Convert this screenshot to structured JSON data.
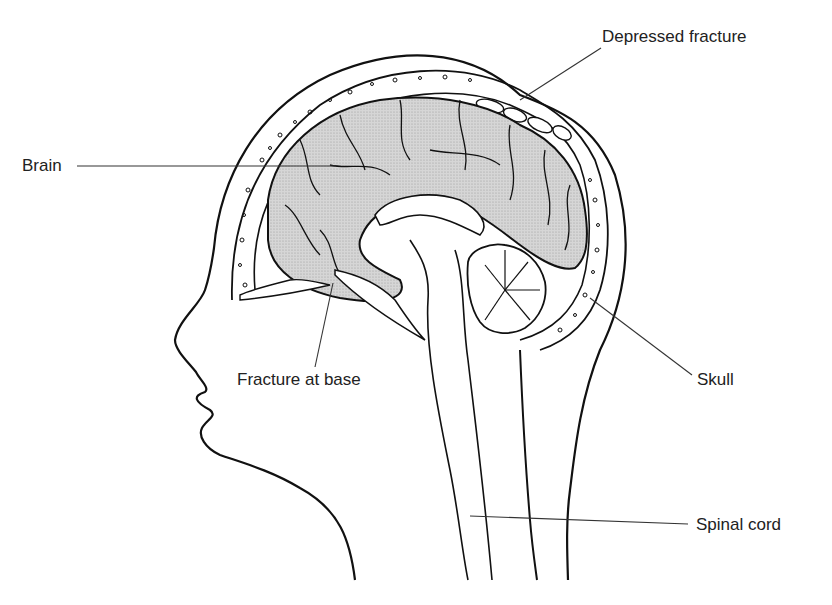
{
  "diagram": {
    "labels": {
      "depressed_fracture": "Depressed fracture",
      "brain": "Brain",
      "fracture_at_base": "Fracture at base",
      "skull": "Skull",
      "spinal_cord": "Spinal cord"
    },
    "colors": {
      "line": "#111111",
      "brain_fill": "#cfcfcf",
      "background": "#ffffff",
      "text": "#222222"
    }
  }
}
